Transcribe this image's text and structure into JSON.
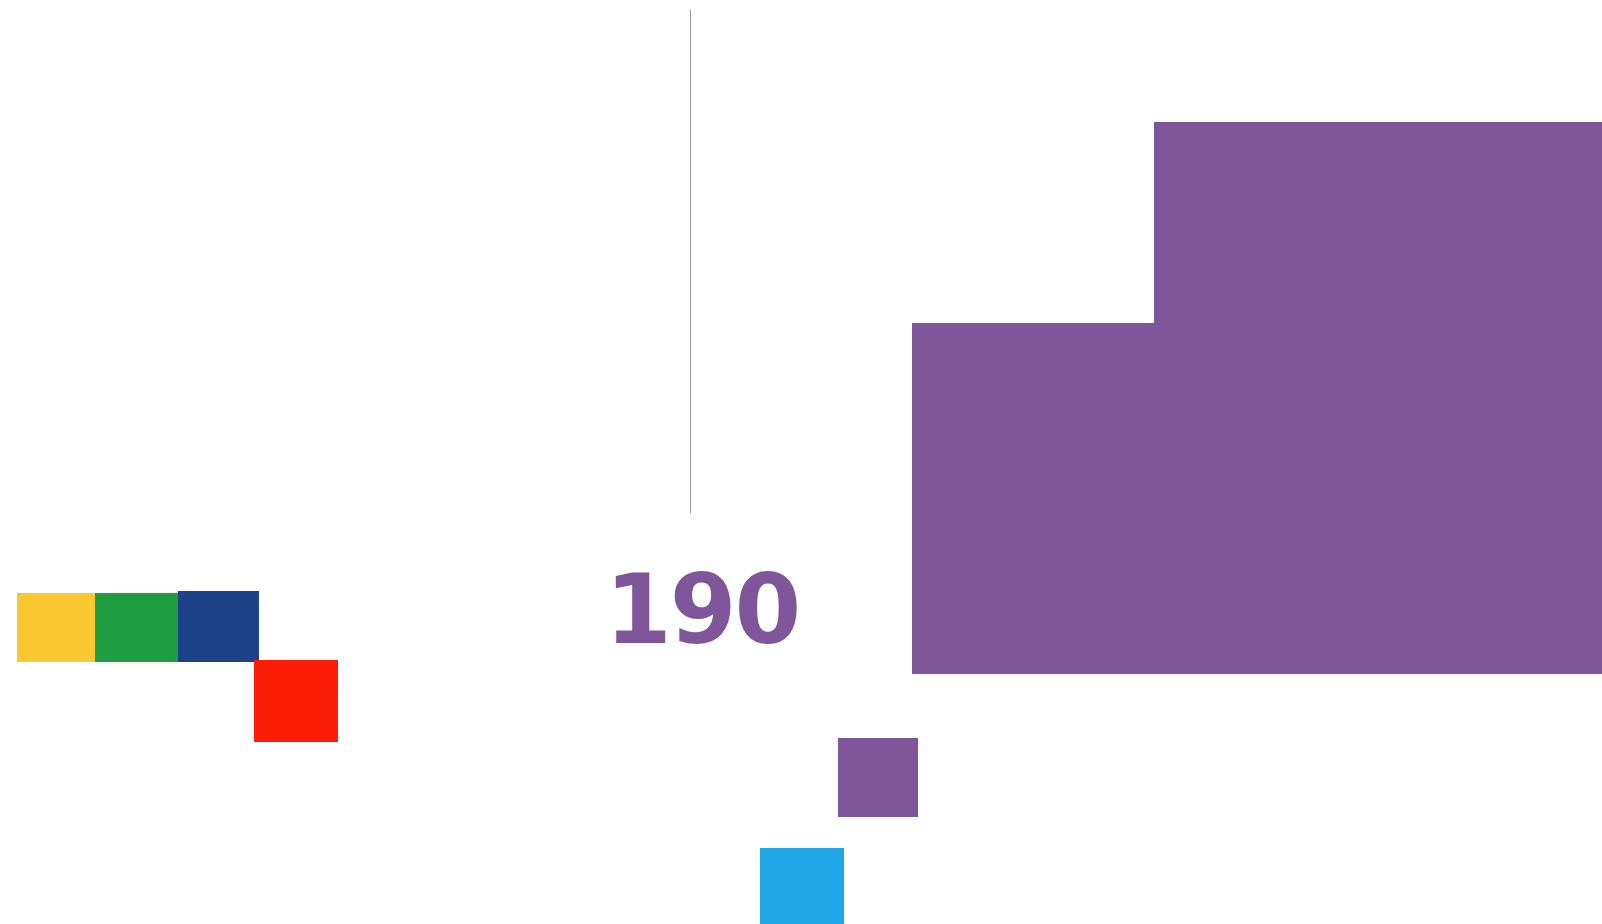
{
  "page": {
    "title": "190",
    "background_color": "#ffffff",
    "width": 1602,
    "height": 924
  },
  "page_number": {
    "label": "190",
    "color": "#7f5699"
  },
  "rule": {
    "name": "vertical-rule",
    "color": "#9b9b9e",
    "orientation": "vertical"
  },
  "decorations": {
    "swatch_row": [
      {
        "name": "yellow",
        "color": "#fbc832"
      },
      {
        "name": "green",
        "color": "#1f9d41"
      },
      {
        "name": "blue",
        "color": "#1e4289"
      }
    ],
    "offset_swatches": [
      {
        "name": "red",
        "color": "#fc1d06"
      },
      {
        "name": "purple",
        "color": "#7f5699"
      },
      {
        "name": "cyan",
        "color": "#21a7e8"
      }
    ]
  },
  "shape": {
    "name": "purple-step-shape",
    "color": "#7f5699",
    "description": "stepped rectangle"
  }
}
